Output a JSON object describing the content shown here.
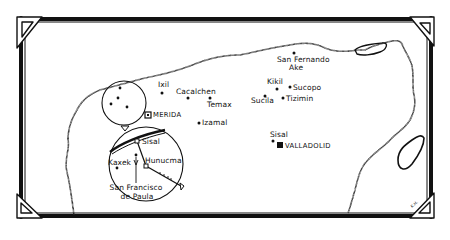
{
  "map": {
    "title": "",
    "region": "Yucatán Peninsula (hand-drawn)",
    "colors": {
      "ink": "#111111",
      "paper": "#ffffff"
    },
    "cities": [
      {
        "name": "MERIDA",
        "marker": "square-outline",
        "type": "capital"
      },
      {
        "name": "VALLADOLID",
        "marker": "square-filled",
        "type": "capital"
      }
    ],
    "towns": [
      {
        "name": "Ixil"
      },
      {
        "name": "Cacalchen"
      },
      {
        "name": "Temax"
      },
      {
        "name": "Izamal"
      },
      {
        "name": "San Fernando Ake",
        "line1": "San Fernando",
        "line2": "Ake"
      },
      {
        "name": "Kikil"
      },
      {
        "name": "Sucopo"
      },
      {
        "name": "Sucila"
      },
      {
        "name": "Tizimin"
      },
      {
        "name": "Sisal",
        "near": "Valladolid"
      }
    ],
    "inset": {
      "towns": [
        {
          "name": "Sisal"
        },
        {
          "name": "Kaxek"
        },
        {
          "name": "Hunucma"
        },
        {
          "name": "San Francisco de Paula",
          "line1": "San Francisco",
          "line2": "de Paula"
        }
      ]
    },
    "signature": "K.H."
  }
}
